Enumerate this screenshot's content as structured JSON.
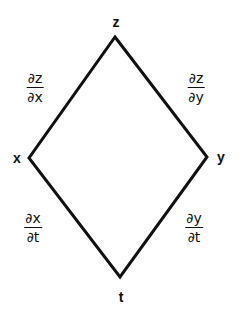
{
  "diagram": {
    "type": "tree-dependency-diagram",
    "stroke_color": "#111111",
    "background": "#ffffff",
    "nodes": {
      "top": {
        "label": "z",
        "x": 115,
        "y": 37,
        "label_x": 116,
        "label_y": 22
      },
      "left": {
        "label": "x",
        "x": 29,
        "y": 158,
        "label_x": 17,
        "label_y": 158
      },
      "right": {
        "label": "y",
        "x": 207,
        "y": 157,
        "label_x": 221,
        "label_y": 157
      },
      "bottom": {
        "label": "t",
        "x": 120,
        "y": 277,
        "label_x": 121,
        "label_y": 297
      }
    },
    "edges": [
      {
        "from": "top",
        "to": "left",
        "label": {
          "numerator": "∂z",
          "denominator": "∂x"
        }
      },
      {
        "from": "top",
        "to": "right",
        "label": {
          "numerator": "∂z",
          "denominator": "∂y"
        }
      },
      {
        "from": "left",
        "to": "bottom",
        "label": {
          "numerator": "∂x",
          "denominator": "∂t"
        }
      },
      {
        "from": "right",
        "to": "bottom",
        "label": {
          "numerator": "∂y",
          "denominator": "∂t"
        }
      }
    ]
  }
}
